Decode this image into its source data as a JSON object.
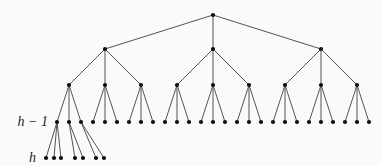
{
  "diagram": {
    "type": "tree",
    "branching_factor": 3,
    "levels": [
      {
        "index": 0,
        "node_count": 1
      },
      {
        "index": 1,
        "node_count": 3
      },
      {
        "index": 2,
        "node_count": 9
      },
      {
        "index": 3,
        "node_count": 27,
        "label": "h − 1"
      },
      {
        "index": 4,
        "node_count": 7,
        "label": "h"
      }
    ],
    "bottom_level_children_per_parent": [
      3,
      2,
      2
    ],
    "labels": {
      "h_minus_1": "h − 1",
      "h": "h"
    },
    "colors": {
      "node": "#0d0d0d",
      "edge": "#3f3f3f",
      "label": "#1c1c1c",
      "background": "#fafafa"
    }
  }
}
